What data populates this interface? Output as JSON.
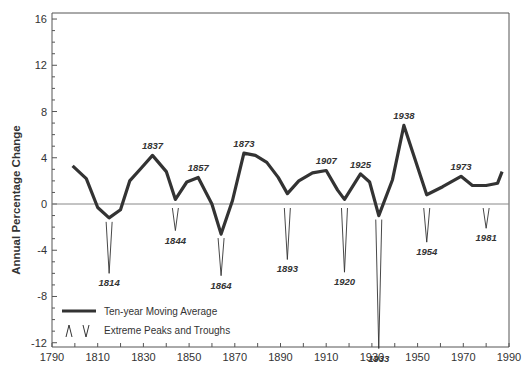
{
  "chart_data": {
    "type": "line",
    "title": "",
    "xlabel": "",
    "ylabel": "Annual Percentage Change",
    "xlim": [
      1790,
      1990
    ],
    "ylim": [
      -13,
      16.5
    ],
    "x_ticks": [
      1790,
      1810,
      1830,
      1850,
      1870,
      1890,
      1910,
      1930,
      1950,
      1970,
      1990
    ],
    "y_ticks": [
      16,
      12,
      8,
      4,
      0,
      -4,
      -8,
      -12
    ],
    "grid": false,
    "zero_line": true,
    "legend_position": "lower-left",
    "legend": [
      "Ten-year Moving Average",
      "Extreme Peaks and Troughs"
    ],
    "series": [
      {
        "name": "Ten-year Moving Average",
        "x": [
          1799,
          1805,
          1810,
          1815,
          1820,
          1824,
          1829,
          1834,
          1840,
          1844,
          1849,
          1854,
          1860,
          1864,
          1869,
          1874,
          1879,
          1884,
          1889,
          1893,
          1898,
          1904,
          1910,
          1915,
          1918,
          1925,
          1929,
          1933,
          1939,
          1944,
          1954,
          1961,
          1969,
          1974,
          1980,
          1985,
          1987
        ],
        "values": [
          3.3,
          2.2,
          -0.3,
          -1.2,
          -0.5,
          2.0,
          3.1,
          4.2,
          2.8,
          0.4,
          1.9,
          2.3,
          0.0,
          -2.6,
          0.3,
          4.4,
          4.2,
          3.6,
          2.3,
          0.9,
          2.0,
          2.7,
          2.9,
          1.2,
          0.4,
          2.6,
          1.9,
          -1.0,
          2.1,
          6.8,
          0.8,
          1.5,
          2.4,
          1.6,
          1.6,
          1.8,
          2.8
        ]
      }
    ],
    "annotations": {
      "peaks": [
        {
          "label": "1837",
          "year": 1834,
          "value": 4.2
        },
        {
          "label": "1857",
          "year": 1854,
          "value": 2.3
        },
        {
          "label": "1873",
          "year": 1874,
          "value": 4.4
        },
        {
          "label": "1907",
          "year": 1910,
          "value": 2.9
        },
        {
          "label": "1925",
          "year": 1925,
          "value": 2.6
        },
        {
          "label": "1938",
          "year": 1944,
          "value": 6.8
        },
        {
          "label": "1973",
          "year": 1969,
          "value": 2.4
        }
      ],
      "troughs": [
        {
          "label": "1814",
          "year": 1815,
          "tip": -6.0
        },
        {
          "label": "1844",
          "year": 1844,
          "tip": -2.3
        },
        {
          "label": "1864",
          "year": 1864,
          "tip": -6.2
        },
        {
          "label": "1893",
          "year": 1893,
          "tip": -4.8
        },
        {
          "label": "1920",
          "year": 1918,
          "tip": -5.9
        },
        {
          "label": "1933",
          "year": 1933,
          "tip": -12.5
        },
        {
          "label": "1954",
          "year": 1954,
          "tip": -3.3
        },
        {
          "label": "1981",
          "year": 1980,
          "tip": -2.1
        }
      ]
    }
  },
  "colors": {
    "line": "#333333",
    "axis": "#555555",
    "zero_line": "#888888",
    "text": "#333333"
  }
}
